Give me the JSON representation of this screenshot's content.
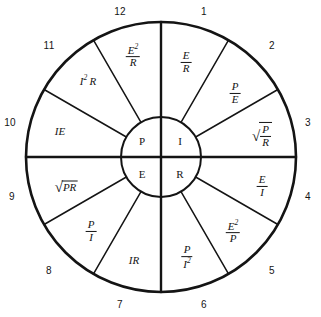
{
  "figure": {
    "geometry": {
      "center_x": 161,
      "center_y": 157,
      "outer_radius": 135,
      "hub_radius": 40,
      "sector_count": 12,
      "sector_degrees": 30
    },
    "colors": {
      "ink": "#141414",
      "background": "#ffffff"
    }
  },
  "hub": {
    "quadrants": [
      {
        "name": "power",
        "symbol": "P"
      },
      {
        "name": "current",
        "symbol": "I"
      },
      {
        "name": "voltage",
        "symbol": "E"
      },
      {
        "name": "resistance",
        "symbol": "R"
      }
    ]
  },
  "tick_numbers": [
    {
      "value": "1",
      "x": 204,
      "y": 12
    },
    {
      "value": "2",
      "x": 272,
      "y": 46
    },
    {
      "value": "3",
      "x": 308,
      "y": 123
    },
    {
      "value": "4",
      "x": 308,
      "y": 197
    },
    {
      "value": "5",
      "x": 272,
      "y": 271
    },
    {
      "value": "6",
      "x": 204,
      "y": 305
    },
    {
      "value": "7",
      "x": 120,
      "y": 305
    },
    {
      "value": "8",
      "x": 49,
      "y": 271
    },
    {
      "value": "9",
      "x": 12,
      "y": 197
    },
    {
      "value": "10",
      "x": 10,
      "y": 123
    },
    {
      "value": "11",
      "x": 49,
      "y": 46
    },
    {
      "value": "12",
      "x": 120,
      "y": 12
    }
  ],
  "sectors": [
    {
      "index": 1,
      "quadrant": "current",
      "solves_for": "I",
      "formula_text": "E/R",
      "numerator": "E",
      "denominator": "R",
      "style": "fraction",
      "x": 186,
      "y": 62
    },
    {
      "index": 2,
      "quadrant": "current",
      "solves_for": "I",
      "formula_text": "P/E",
      "numerator": "P",
      "denominator": "E",
      "style": "fraction",
      "x": 235,
      "y": 93
    },
    {
      "index": 3,
      "quadrant": "current",
      "solves_for": "I",
      "formula_text": "sqrt(P/R)",
      "numerator": "P",
      "denominator": "R",
      "style": "radical-fraction",
      "x": 262,
      "y": 135
    },
    {
      "index": 4,
      "quadrant": "resistance",
      "solves_for": "R",
      "formula_text": "E/I",
      "numerator": "E",
      "denominator": "I",
      "style": "fraction",
      "x": 262,
      "y": 186
    },
    {
      "index": 5,
      "quadrant": "resistance",
      "solves_for": "R",
      "formula_text": "E^2/P",
      "numerator": "E",
      "numerator_exponent": "2",
      "denominator": "P",
      "style": "fraction",
      "x": 233,
      "y": 232
    },
    {
      "index": 6,
      "quadrant": "resistance",
      "solves_for": "R",
      "formula_text": "P/I^2",
      "numerator": "P",
      "denominator": "I",
      "denominator_exponent": "2",
      "style": "fraction",
      "x": 187,
      "y": 257
    },
    {
      "index": 7,
      "quadrant": "voltage",
      "solves_for": "E",
      "formula_text": "IR",
      "style": "plain",
      "x": 134,
      "y": 260
    },
    {
      "index": 8,
      "quadrant": "voltage",
      "solves_for": "E",
      "formula_text": "P/I",
      "numerator": "P",
      "denominator": "I",
      "style": "fraction",
      "x": 91,
      "y": 231
    },
    {
      "index": 9,
      "quadrant": "voltage",
      "solves_for": "E",
      "formula_text": "sqrt(PR)",
      "radicand": "PR",
      "style": "radical-plain",
      "x": 66,
      "y": 186
    },
    {
      "index": 10,
      "quadrant": "power",
      "solves_for": "P",
      "formula_text": "IE",
      "style": "plain",
      "x": 60,
      "y": 131
    },
    {
      "index": 11,
      "quadrant": "power",
      "solves_for": "P",
      "formula_text": "I^2 R",
      "style": "plain-exponent",
      "base": "I",
      "exponent": "2",
      "tail": "R",
      "x": 88,
      "y": 80
    },
    {
      "index": 12,
      "quadrant": "power",
      "solves_for": "P",
      "formula_text": "E^2/R",
      "numerator": "E",
      "numerator_exponent": "2",
      "denominator": "R",
      "style": "fraction",
      "x": 133,
      "y": 56
    }
  ]
}
